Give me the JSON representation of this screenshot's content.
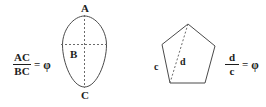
{
  "figure": {
    "background_color": "#ffffff",
    "stroke_color": "#4a4a4a",
    "dash_color": "#6a6a6a",
    "text_color": "#1d1d1d"
  },
  "left_panel": {
    "equation": {
      "numerator": "AC",
      "denominator": "BC",
      "equals": "=",
      "value": "φ"
    },
    "shape": {
      "kind": "egg-oval",
      "labels": {
        "top": "A",
        "middle": "B",
        "bottom": "C"
      },
      "axes": {
        "vertical": "dashed",
        "horizontal": "dashed"
      }
    }
  },
  "right_panel": {
    "shape": {
      "kind": "pentagon",
      "labels": {
        "side": "c",
        "diagonal": "d"
      },
      "diagonal_style": "dashed"
    },
    "equation": {
      "numerator": "d",
      "denominator": "c",
      "equals": "=",
      "value": "φ"
    }
  }
}
